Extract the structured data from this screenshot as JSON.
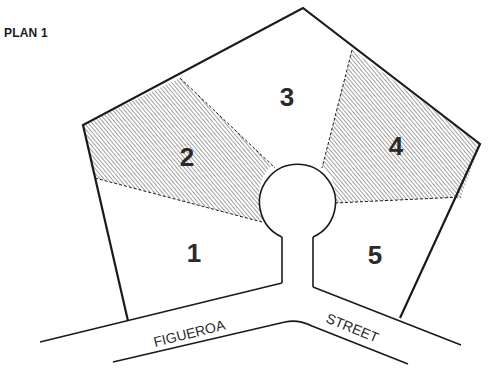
{
  "title": "PLAN 1",
  "lots": [
    {
      "number": "1",
      "shaded": false
    },
    {
      "number": "2",
      "shaded": true
    },
    {
      "number": "3",
      "shaded": false
    },
    {
      "number": "4",
      "shaded": true
    },
    {
      "number": "5",
      "shaded": false
    }
  ],
  "street": {
    "left_label": "FIGUEROA",
    "right_label": "STREET"
  },
  "colors": {
    "line": "#1a1a1a",
    "hatch": "#555555",
    "background": "#ffffff"
  }
}
